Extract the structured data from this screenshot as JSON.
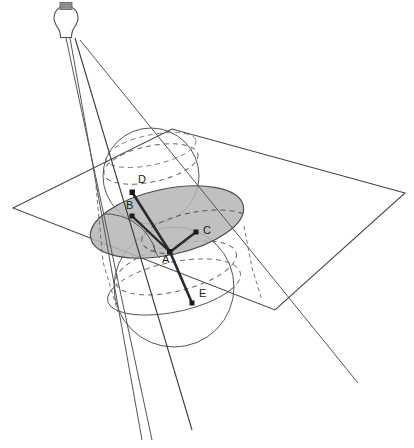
{
  "figure": {
    "background_color": "#ffffff",
    "line_color": "#444444",
    "thick_line_color": "#333333",
    "ellipse_fill": "#b5b5b5",
    "ellipse_stroke": "#555555",
    "dash_color": "#666666",
    "label_color": "#1a1a1a"
  },
  "lamp": {
    "name": "light-bulb",
    "glass_color": "#ffffff",
    "outline_color": "#555555",
    "base_color": "#888888",
    "cx": 66,
    "cy": 24,
    "rays": 3
  },
  "plane": {
    "name": "cutting-plane",
    "stroke": "#444444",
    "points": "13,208 172,129 405,193 275,310"
  },
  "spheres": [
    {
      "name": "upper-sphere",
      "cx": 151,
      "cy": 176,
      "r": 48
    },
    {
      "name": "lower-sphere",
      "cx": 174,
      "cy": 287,
      "r": 60
    }
  ],
  "ellipse": {
    "name": "conic-section-ellipse",
    "cx": 167,
    "cy": 222,
    "rx": 78,
    "ry": 33,
    "rotation": -12
  },
  "points": [
    {
      "id": "A",
      "label": "A",
      "x": 170,
      "y": 252,
      "label_x": 162,
      "label_y": 263,
      "role": "apex-contact-point"
    },
    {
      "id": "B",
      "label": "B",
      "x": 132,
      "y": 216,
      "label_x": 126,
      "label_y": 209,
      "role": "focus-left"
    },
    {
      "id": "C",
      "label": "C",
      "x": 196,
      "y": 232,
      "label_x": 203,
      "label_y": 234,
      "role": "focus-right"
    },
    {
      "id": "D",
      "label": "D",
      "x": 132,
      "y": 192,
      "label_x": 138,
      "label_y": 183,
      "role": "upper-tangency-point"
    },
    {
      "id": "E",
      "label": "E",
      "x": 192,
      "y": 303,
      "label_x": 199,
      "label_y": 297,
      "role": "lower-tangency-point"
    }
  ],
  "segments": [
    {
      "name": "segment-a-b",
      "from": "A",
      "to": "B"
    },
    {
      "name": "segment-a-c",
      "from": "A",
      "to": "C"
    },
    {
      "name": "segment-a-d",
      "from": "A",
      "to": "D"
    },
    {
      "name": "segment-a-e",
      "from": "A",
      "to": "E"
    }
  ],
  "cone_rays": [
    {
      "name": "cone-ray-left-outer",
      "x1": 66,
      "y1": 38,
      "x2": 152,
      "y2": 440
    },
    {
      "name": "cone-ray-left-inner",
      "x1": 70,
      "y1": 38,
      "x2": 142,
      "y2": 440
    },
    {
      "name": "cone-ray-through-a",
      "x1": 75,
      "y1": 38,
      "x2": 192,
      "y2": 430
    },
    {
      "name": "cone-ray-right",
      "x1": 80,
      "y1": 40,
      "x2": 358,
      "y2": 383
    }
  ],
  "angle_marks": [
    {
      "name": "angle-mark-at-a",
      "cx": 170,
      "cy": 252,
      "r": 17
    }
  ]
}
